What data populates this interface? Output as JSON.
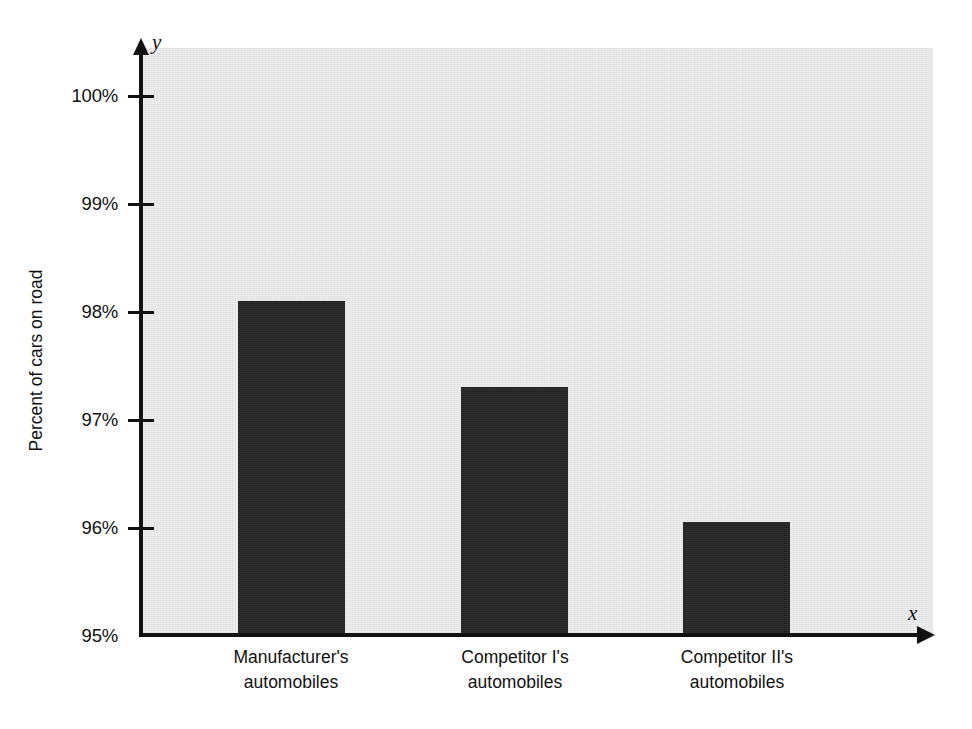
{
  "chart_data": {
    "type": "bar",
    "title": "",
    "subtitle": "",
    "xlabel": "",
    "ylabel": "Percent of cars on road",
    "x_axis_letter": "x",
    "y_axis_letter": "y",
    "categories": [
      "Manufacturer's automobiles",
      "Competitor I's automobiles",
      "Competitor II's automobiles"
    ],
    "category_lines": [
      [
        "Manufacturer's",
        "automobiles"
      ],
      [
        "Competitor I's",
        "automobiles"
      ],
      [
        "Competitor II's",
        "automobiles"
      ]
    ],
    "values": [
      98.1,
      97.3,
      96.05
    ],
    "value_labels": [
      "98.1%",
      "97.3%",
      "96.05%"
    ],
    "ylim": [
      95,
      100
    ],
    "yticks": [
      95,
      96,
      97,
      98,
      99,
      100
    ],
    "ytick_labels": [
      "95%",
      "96%",
      "97%",
      "98%",
      "99%",
      "100%"
    ],
    "grid": false,
    "legend": "none",
    "bar_color": "#262626",
    "panel_color": "#ececec",
    "axis_color": "#111111"
  },
  "ytick_labels": {
    "t100": "100%",
    "t99": "99%",
    "t98": "98%",
    "t97": "97%",
    "t96": "96%",
    "t95": "95%"
  },
  "axis": {
    "y_title": "Percent of cars on road",
    "y_letter": "y",
    "x_letter": "x"
  },
  "categories": {
    "c0_line1": "Manufacturer's",
    "c0_line2": "automobiles",
    "c1_line1": "Competitor I's",
    "c1_line2": "automobiles",
    "c2_line1": "Competitor II's",
    "c2_line2": "automobiles"
  }
}
